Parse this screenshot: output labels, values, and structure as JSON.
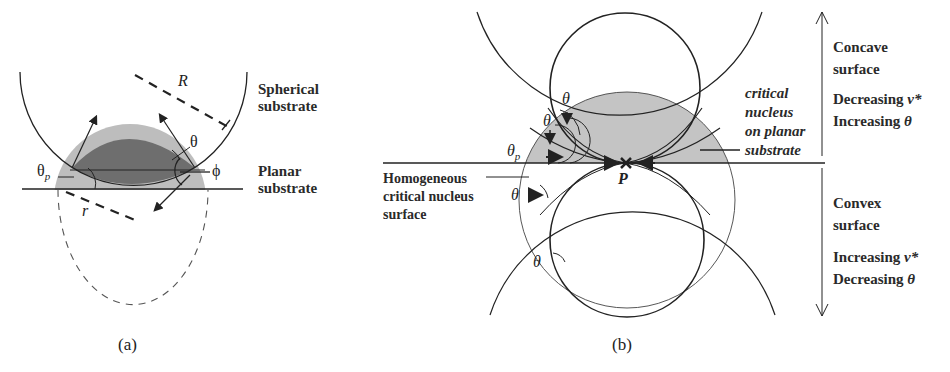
{
  "panel_a": {
    "caption": "(a)",
    "labels": {
      "spherical_line1": "Spherical",
      "spherical_line2": "substrate",
      "planar_line1": "Planar",
      "planar_line2": "substrate",
      "R": "R",
      "r": "r",
      "theta": "θ",
      "theta_p": "θ",
      "theta_p_sub": "p",
      "phi": "ϕ"
    }
  },
  "panel_b": {
    "caption": "(b)",
    "labels": {
      "concave_line1": "Concave",
      "concave_line2": "surface",
      "concave_dec": "Decreasing",
      "concave_dec_sym": "v*",
      "concave_inc": "Increasing",
      "concave_inc_sym": "θ",
      "convex_line1": "Convex",
      "convex_line2": "surface",
      "convex_inc": "Increasing",
      "convex_inc_sym": "v*",
      "convex_dec": "Decreasing",
      "convex_dec_sym": "θ",
      "critical_line1": "critical",
      "critical_line2": "nucleus",
      "critical_line3": "on planar",
      "critical_line4": "substrate",
      "homog_line1": "Homogeneous",
      "homog_line2": "critical nucleus",
      "homog_line3": "surface",
      "P": "P",
      "theta_top": "θ",
      "theta_mid": "θ",
      "theta_p": "θ",
      "theta_p_sub": "p",
      "theta_low": "θ",
      "theta_bottom": "θ"
    }
  },
  "colors": {
    "dark_nucleus": "#6e6e6e",
    "light_cap": "#bdbdbd",
    "line": "#222222"
  }
}
